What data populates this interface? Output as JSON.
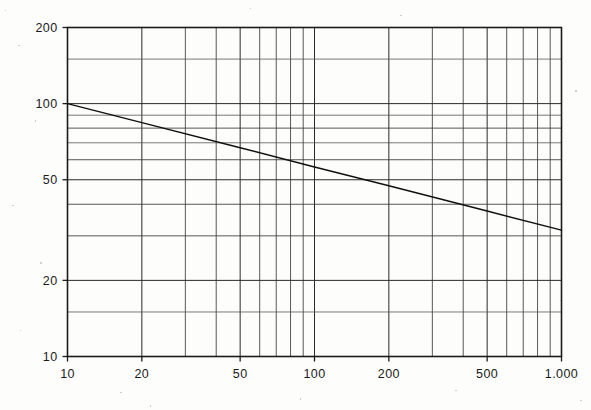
{
  "chart_data": {
    "type": "line",
    "title": "",
    "subtitle": "",
    "xlabel": "",
    "ylabel": "",
    "xscale": "log",
    "yscale": "log",
    "xlim": [
      10,
      1000
    ],
    "ylim": [
      10,
      200
    ],
    "grid": true,
    "legend": null,
    "x_tick_labels": [
      "10",
      "20",
      "50",
      "100",
      "200",
      "500",
      "1.000"
    ],
    "x_tick_values": [
      10,
      20,
      50,
      100,
      200,
      500,
      1000
    ],
    "y_tick_labels": [
      "200",
      "100",
      "50",
      "20",
      "10"
    ],
    "y_tick_values": [
      200,
      100,
      50,
      20,
      10
    ],
    "x_major_gridlines": [
      10,
      20,
      30,
      40,
      50,
      60,
      70,
      80,
      90,
      100,
      200,
      300,
      400,
      500,
      600,
      700,
      800,
      900,
      1000
    ],
    "y_major_gridlines": [
      10,
      15,
      20,
      30,
      40,
      50,
      60,
      70,
      80,
      90,
      100,
      150,
      200
    ],
    "series": [
      {
        "name": "power-law-line",
        "color": "#101010",
        "slope_loglog": -0.25,
        "x": [
          10,
          20,
          50,
          100,
          200,
          500,
          1000
        ],
        "y": [
          100,
          84.1,
          66.9,
          56.2,
          47.3,
          37.6,
          31.6
        ]
      }
    ],
    "annotations": []
  },
  "axes": {
    "x_axis_name": "x-axis",
    "y_axis_name": "y-axis"
  },
  "figure": {
    "background": "#fdfdfc",
    "line_color": "#101010",
    "grid_color": "#2a2a2a",
    "axis_color": "#1b1b1b"
  }
}
